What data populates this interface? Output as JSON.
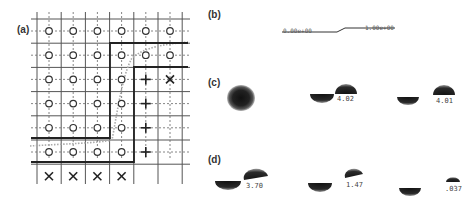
{
  "figure": {
    "panels": [
      {
        "id": "a",
        "label": "(a)"
      },
      {
        "id": "b",
        "label": "(b)"
      },
      {
        "id": "c",
        "label": "(c)"
      },
      {
        "id": "d",
        "label": "(d)"
      }
    ],
    "panel_a": {
      "description": "7x7 grid of cells with markers: circle = interior, plus = boundary, cross = exterior",
      "rows": [
        [
          "o",
          "o",
          "o",
          "o",
          "o",
          "o",
          ""
        ],
        [
          "o",
          "o",
          "o",
          "o",
          "o",
          "o",
          ""
        ],
        [
          "o",
          "o",
          "o",
          "o",
          "+",
          "x",
          ""
        ],
        [
          "o",
          "o",
          "o",
          "o",
          "+",
          "",
          ""
        ],
        [
          "o",
          "o",
          "o",
          "o",
          "+",
          "",
          ""
        ],
        [
          "o",
          "o",
          "o",
          "o",
          "+",
          "",
          ""
        ],
        [
          "x",
          "x",
          "x",
          "x",
          "",
          "",
          ""
        ]
      ],
      "marker_symbols": {
        "o": "○",
        "+": "+",
        "x": "×"
      }
    },
    "panel_b": {
      "left_label": "0.00e+00",
      "right_label": "1.00e+00"
    },
    "panel_c": {
      "values": [
        "4.02",
        "4.01"
      ]
    },
    "panel_d": {
      "values": [
        "3.70",
        "1.47",
        ".037"
      ]
    }
  }
}
